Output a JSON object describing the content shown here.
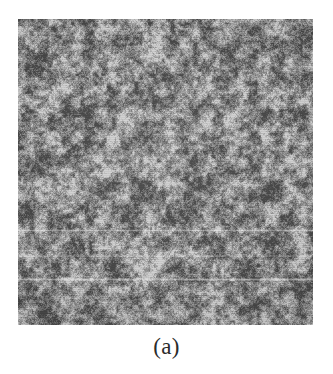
{
  "figure": {
    "caption": "(a)",
    "image": {
      "name": "micrograph-grayscale-texture",
      "kind": "grayscale-micrograph",
      "alt_text": "Fine-grained grayscale micrograph texture",
      "x": 18,
      "y": 19,
      "width": 295,
      "height": 306,
      "base_gray": "#8d8d8d",
      "dark_gray": "#4a4a4a",
      "light_gray": "#d2d2d2",
      "grain_scale_px": 2,
      "contrast": 0.62,
      "artifacts": [
        {
          "name": "scanline-upper",
          "y": 210,
          "height": 3,
          "opacity": 0.34
        },
        {
          "name": "scanline-mid",
          "y": 236,
          "height": 2,
          "opacity": 0.3
        },
        {
          "name": "scanline-lower",
          "y": 259,
          "height": 3,
          "opacity": 0.4
        }
      ]
    },
    "page_background": "#ffffff"
  }
}
